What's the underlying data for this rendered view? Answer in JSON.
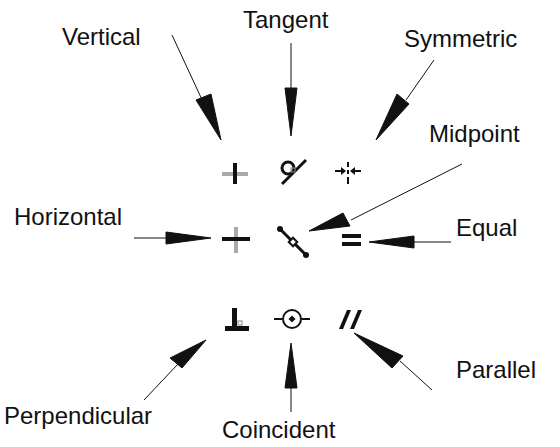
{
  "diagram": {
    "labels": {
      "vertical": "Vertical",
      "tangent": "Tangent",
      "symmetric": "Symmetric",
      "midpoint": "Midpoint",
      "horizontal": "Horizontal",
      "equal": "Equal",
      "perpendicular": "Perpendicular",
      "coincident": "Coincident",
      "parallel": "Parallel"
    },
    "icons": [
      {
        "name": "vertical-icon",
        "row": 1,
        "col": 1
      },
      {
        "name": "tangent-icon",
        "row": 1,
        "col": 2
      },
      {
        "name": "symmetric-icon",
        "row": 1,
        "col": 3
      },
      {
        "name": "horizontal-icon",
        "row": 2,
        "col": 1
      },
      {
        "name": "midpoint-icon",
        "row": 2,
        "col": 2
      },
      {
        "name": "equal-icon",
        "row": 2,
        "col": 3
      },
      {
        "name": "perpendicular-icon",
        "row": 3,
        "col": 1
      },
      {
        "name": "coincident-icon",
        "row": 3,
        "col": 2
      },
      {
        "name": "parallel-icon",
        "row": 3,
        "col": 3
      }
    ],
    "colors": {
      "ink": "#111111",
      "muted": "#aaaaaa",
      "background": "#ffffff"
    }
  }
}
